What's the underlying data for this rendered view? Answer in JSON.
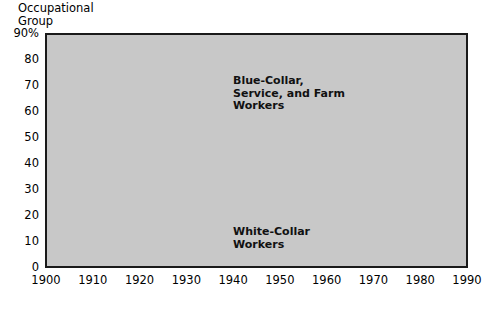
{
  "axis_title": "Occupational\nGroup",
  "series_labels": {
    "blue_collar": "Blue-Collar,\nService, and Farm\nWorkers",
    "white_collar": "White-Collar\nWorkers"
  },
  "colors": {
    "plot_background": "#c8c8c8",
    "plot_border": "#1a1a1a",
    "gridline": "#f2f2f2",
    "line": "#555555",
    "text": "#000000"
  },
  "y_ticks": [
    "90%",
    "80",
    "70",
    "60",
    "50",
    "40",
    "30",
    "20",
    "10",
    "0"
  ],
  "x_ticks": [
    "1900",
    "1910",
    "1920",
    "1930",
    "1940",
    "1950",
    "1960",
    "1970",
    "1980",
    "1990"
  ],
  "chart_data": {
    "type": "line",
    "title": "Occupational Group",
    "xlabel": "",
    "ylabel": "Occupational Group",
    "x": [
      1900,
      1910,
      1920,
      1930,
      1940,
      1950,
      1960,
      1970,
      1980,
      1990
    ],
    "xlim": [
      1900,
      1990
    ],
    "ylim": [
      0,
      90
    ],
    "grid": true,
    "legend": "inline-annotations",
    "series": [
      {
        "name": "Blue-Collar, Service, and Farm Workers",
        "values": [
          82,
          78,
          76,
          73,
          69,
          65,
          59,
          53,
          50,
          41
        ]
      },
      {
        "name": "White-Collar Workers",
        "values": [
          17,
          22,
          25,
          29,
          32,
          37,
          43,
          48,
          52,
          62
        ]
      }
    ],
    "annotations": [
      {
        "text": "Blue-Collar, Service, and Farm Workers",
        "x": 1930,
        "y": 86
      },
      {
        "text": "White-Collar Workers",
        "x": 1930,
        "y": 28
      }
    ]
  }
}
